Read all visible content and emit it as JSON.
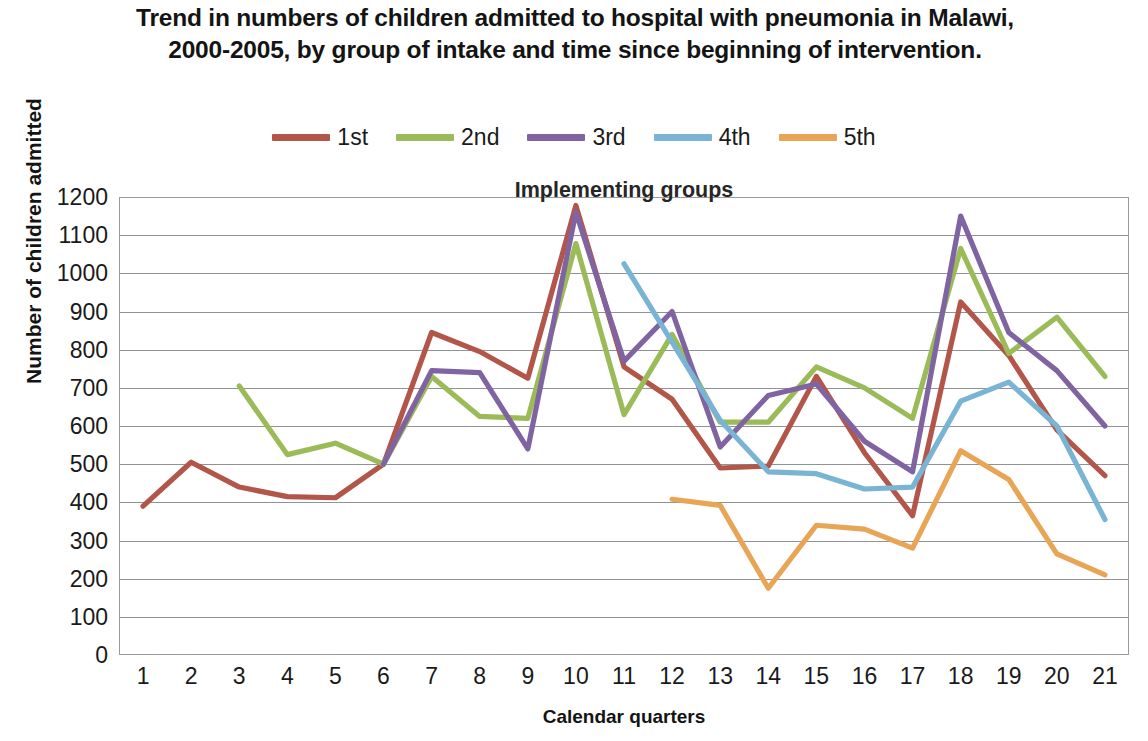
{
  "title": "Trend in numbers of children admitted to hospital with pneumonia in Malawi, 2000-2005, by group of intake and time since beginning of intervention.",
  "plot_annotation": "Implementing groups",
  "axes": {
    "y_title": "Number of children admitted",
    "x_title": "Calendar quarters",
    "y_ticks": [
      "1200",
      "1100",
      "1000",
      "900",
      "800",
      "700",
      "600",
      "500",
      "400",
      "300",
      "200",
      "100",
      "0"
    ],
    "x_ticks": [
      "1",
      "2",
      "3",
      "4",
      "5",
      "6",
      "7",
      "8",
      "9",
      "10",
      "11",
      "12",
      "13",
      "14",
      "15",
      "16",
      "17",
      "18",
      "19",
      "20",
      "21"
    ]
  },
  "legend": {
    "entries": [
      {
        "label": "1st",
        "color": "#b3564a"
      },
      {
        "label": "2nd",
        "color": "#9bbb59"
      },
      {
        "label": "3rd",
        "color": "#8064a2"
      },
      {
        "label": "4th",
        "color": "#79b4d4"
      },
      {
        "label": "5th",
        "color": "#e8a556"
      }
    ]
  },
  "chart_data": {
    "type": "line",
    "title": "Trend in numbers of children admitted to hospital with pneumonia in Malawi, 2000-2005, by group of intake and time since beginning of intervention.",
    "annotation": "Implementing groups",
    "xlabel": "Calendar quarters",
    "ylabel": "Number of children admitted",
    "ylim": [
      0,
      1200
    ],
    "ytick_interval": 100,
    "grid": true,
    "legend_position": "top-center",
    "categories": [
      "1",
      "2",
      "3",
      "4",
      "5",
      "6",
      "7",
      "8",
      "9",
      "10",
      "11",
      "12",
      "13",
      "14",
      "15",
      "16",
      "17",
      "18",
      "19",
      "20",
      "21"
    ],
    "series": [
      {
        "name": "1st",
        "color": "#b3564a",
        "values": [
          390,
          505,
          440,
          415,
          412,
          500,
          845,
          795,
          725,
          1178,
          755,
          670,
          490,
          495,
          730,
          530,
          365,
          925,
          785,
          590,
          470
        ]
      },
      {
        "name": "2nd",
        "color": "#9bbb59",
        "values": [
          null,
          null,
          705,
          525,
          555,
          500,
          730,
          625,
          620,
          1078,
          630,
          840,
          610,
          610,
          755,
          700,
          620,
          1065,
          790,
          885,
          730
        ]
      },
      {
        "name": "3rd",
        "color": "#8064a2",
        "values": [
          null,
          null,
          null,
          null,
          null,
          500,
          745,
          740,
          540,
          1160,
          770,
          900,
          545,
          680,
          710,
          560,
          480,
          1150,
          845,
          745,
          600
        ]
      },
      {
        "name": "4th",
        "color": "#79b4d4",
        "values": [
          null,
          null,
          null,
          null,
          null,
          null,
          null,
          null,
          null,
          null,
          1025,
          820,
          615,
          480,
          475,
          435,
          440,
          665,
          715,
          600,
          355
        ]
      },
      {
        "name": "5th",
        "color": "#e8a556",
        "values": [
          null,
          null,
          null,
          null,
          null,
          null,
          null,
          null,
          null,
          null,
          null,
          408,
          392,
          175,
          340,
          330,
          280,
          535,
          460,
          265,
          210
        ]
      }
    ]
  }
}
